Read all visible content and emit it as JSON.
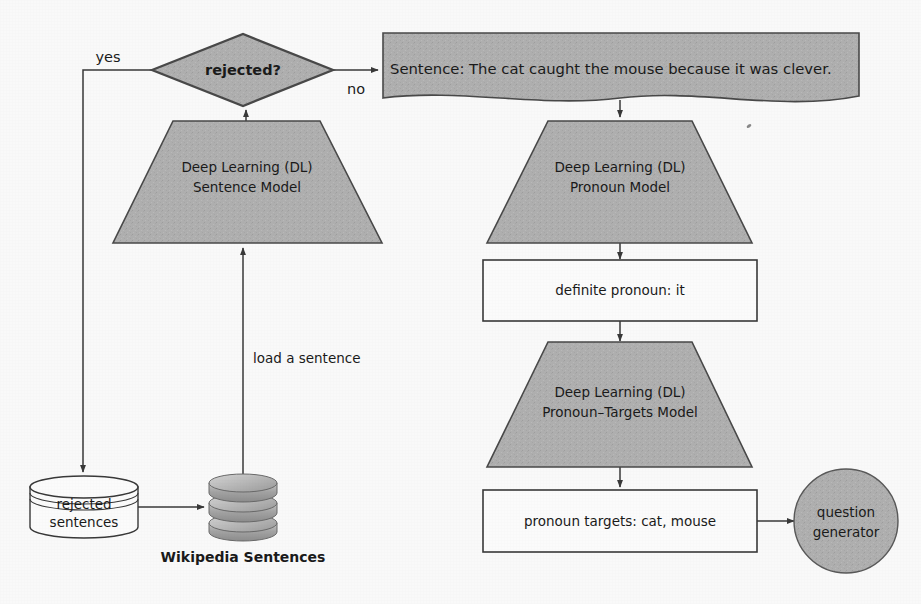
{
  "diagram": {
    "colors": {
      "shape_fill_gray": "#b0b0b0",
      "shape_fill_white": "#ffffff",
      "stroke": "#3a3a3a",
      "text": "#1b1b1b",
      "background": "#fdfdfd"
    },
    "nodes": {
      "decision_rejected": {
        "label": "rejected?",
        "shape": "diamond",
        "fill": "gray"
      },
      "sentence_document": {
        "label": "Sentence: The cat caught the mouse because it was clever.",
        "shape": "document",
        "fill": "gray"
      },
      "dl_sentence_model": {
        "line1": "Deep Learning (DL)",
        "line2": "Sentence Model",
        "shape": "trapezoid",
        "fill": "gray"
      },
      "dl_pronoun_model": {
        "line1": "Deep Learning (DL)",
        "line2": "Pronoun Model",
        "shape": "trapezoid",
        "fill": "gray"
      },
      "definite_pronoun": {
        "label": "definite pronoun: it",
        "shape": "rectangle",
        "fill": "white"
      },
      "dl_pronoun_targets_model": {
        "line1": "Deep Learning (DL)",
        "line2": "Pronoun–Targets Model",
        "shape": "trapezoid",
        "fill": "gray"
      },
      "pronoun_targets": {
        "label": "pronoun targets: cat, mouse",
        "shape": "rectangle",
        "fill": "white"
      },
      "question_generator": {
        "line1": "question",
        "line2": "generator",
        "shape": "circle",
        "fill": "gray"
      },
      "rejected_sentences_store": {
        "line1": "rejected",
        "line2": "sentences",
        "shape": "cylinder",
        "fill": "white"
      },
      "wikipedia_sentences_store": {
        "label": "Wikipedia Sentences",
        "shape": "database-stack",
        "fill": "gray"
      }
    },
    "edge_labels": {
      "yes": "yes",
      "no": "no",
      "load_a_sentence": "load a sentence"
    }
  }
}
